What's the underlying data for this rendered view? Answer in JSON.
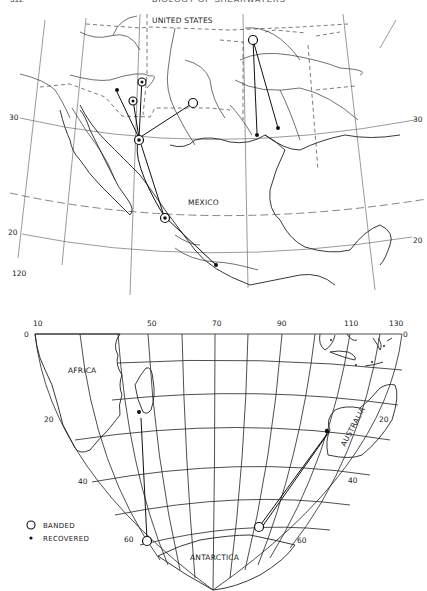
{
  "page_header": {
    "page_number": "312",
    "running_title": "BIOLOGY OF SHEARWATERS"
  },
  "top_map": {
    "region_labels": {
      "united_states": "UNITED STATES",
      "mexico": "MEXICO"
    },
    "latitude_labels": {
      "lat30_left": "30",
      "lat30_right": "30",
      "lat20_left": "20",
      "lat20_right": "20"
    },
    "longitude_labels": {
      "lon120": "120",
      "lon110": "110",
      "lon100": "100",
      "lon90": "9 0"
    }
  },
  "bottom_map": {
    "region_labels": {
      "africa": "AFRICA",
      "australia": "AUSTRALIA",
      "antarctica": "ANTARCTICA"
    },
    "longitude_labels": [
      "10",
      "50",
      "70",
      "90",
      "110",
      "130"
    ],
    "latitude_labels_left": {
      "lat0": "0",
      "lat20": "20",
      "lat40": "40",
      "lat60": "60"
    },
    "latitude_labels_right": {
      "lat0": "0",
      "lat20": "20",
      "lat40": "40",
      "lat60": "60"
    }
  },
  "legend": {
    "banded_label": "BANDED",
    "recovered_label": "RECOVERED",
    "banded_symbol": "open-circle",
    "recovered_symbol": "filled-dot"
  },
  "colors": {
    "ink": "#1a1a1a",
    "paper": "#ffffff",
    "grid": "#555555"
  }
}
